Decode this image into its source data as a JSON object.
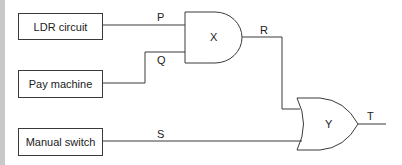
{
  "diagram": {
    "inputs": [
      {
        "id": "ldr",
        "label": "LDR circuit",
        "signal": "P"
      },
      {
        "id": "pay",
        "label": "Pay machine",
        "signal": "Q"
      },
      {
        "id": "manual",
        "label": "Manual switch",
        "signal": "S"
      }
    ],
    "gates": [
      {
        "id": "X",
        "label": "X",
        "type": "AND",
        "inputs": [
          "P",
          "Q"
        ],
        "output": "R"
      },
      {
        "id": "Y",
        "label": "Y",
        "type": "OR",
        "inputs": [
          "R",
          "S"
        ],
        "output": "T"
      }
    ],
    "signals": {
      "P": "P",
      "Q": "Q",
      "R": "R",
      "S": "S",
      "T": "T"
    },
    "colors": {
      "line": "#3a3a3a",
      "strip": "#c8c8c8",
      "background": "#ffffff"
    }
  }
}
